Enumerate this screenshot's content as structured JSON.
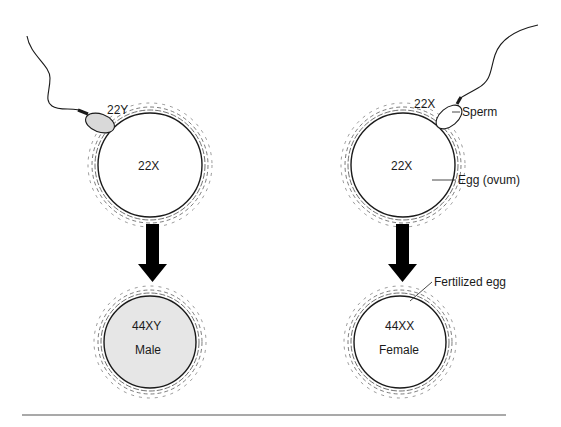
{
  "diagram": {
    "left": {
      "sperm_label": "22Y",
      "egg_label": "22X",
      "result_karyotype": "44XY",
      "result_sex": "Male",
      "result_fill": "#e6e6e6"
    },
    "right": {
      "sperm_label": "22X",
      "egg_label": "22X",
      "sperm_callout": "Sperm",
      "egg_callout": "Egg (ovum)",
      "fertilized_callout": "Fertilized egg",
      "result_karyotype": "44XX",
      "result_sex": "Female",
      "result_fill": "#ffffff"
    },
    "colors": {
      "outline": "#1a1a1a",
      "sperm_head_left": "#d9d9d9",
      "arrow": "#000000",
      "rule": "#555555"
    }
  }
}
